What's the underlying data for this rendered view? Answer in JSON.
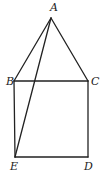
{
  "figure": {
    "points": {
      "A": {
        "label": "A",
        "x": 51,
        "y": 18,
        "lx": 50,
        "ly": 11
      },
      "B": {
        "label": "B",
        "x": 14,
        "y": 81,
        "lx": 6,
        "ly": 85
      },
      "C": {
        "label": "C",
        "x": 88,
        "y": 81,
        "lx": 91,
        "ly": 85
      },
      "D": {
        "label": "D",
        "x": 88,
        "y": 157,
        "lx": 84,
        "ly": 170
      },
      "E": {
        "label": "E",
        "x": 15,
        "y": 157,
        "lx": 10,
        "ly": 170
      }
    },
    "segments": [
      {
        "name": "segment-AB",
        "from": "A",
        "to": "B"
      },
      {
        "name": "segment-AC",
        "from": "A",
        "to": "C"
      },
      {
        "name": "segment-AE",
        "from": "A",
        "to": "E"
      },
      {
        "name": "segment-BC",
        "from": "B",
        "to": "C"
      },
      {
        "name": "segment-BE",
        "from": "B",
        "to": "E"
      },
      {
        "name": "segment-CD",
        "from": "C",
        "to": "D"
      },
      {
        "name": "segment-ED",
        "from": "E",
        "to": "D"
      }
    ],
    "stroke_color": "#222222"
  }
}
